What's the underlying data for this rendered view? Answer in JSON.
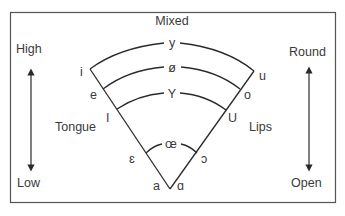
{
  "diagram": {
    "colors": {
      "ink": "#3a3a3a",
      "frame": "#555555",
      "background": "#ffffff"
    },
    "labels": {
      "top_center": "Mixed",
      "left_top": "High",
      "left_bottom": "Low",
      "left_side": "Tongue",
      "right_top": "Round",
      "right_bottom": "Open",
      "right_side": "Lips"
    },
    "arcs": [
      {
        "level": 1,
        "center_symbol": "y",
        "left_symbol": "i",
        "right_symbol": "u"
      },
      {
        "level": 2,
        "center_symbol": "ø",
        "left_symbol": "e",
        "right_symbol": "o"
      },
      {
        "level": 3,
        "center_symbol": "Y",
        "left_symbol": "I",
        "right_symbol": "U"
      },
      {
        "level": 4,
        "center_symbol": "œ",
        "left_symbol": "ɛ",
        "right_symbol": "ɔ"
      }
    ],
    "apex": {
      "left_symbol": "a",
      "right_symbol": "ɑ"
    },
    "axes": {
      "left_arrow": {
        "from": "High",
        "to": "Low",
        "meaning": "Tongue height"
      },
      "right_arrow": {
        "from": "Round",
        "to": "Open",
        "meaning": "Lip rounding"
      }
    }
  }
}
